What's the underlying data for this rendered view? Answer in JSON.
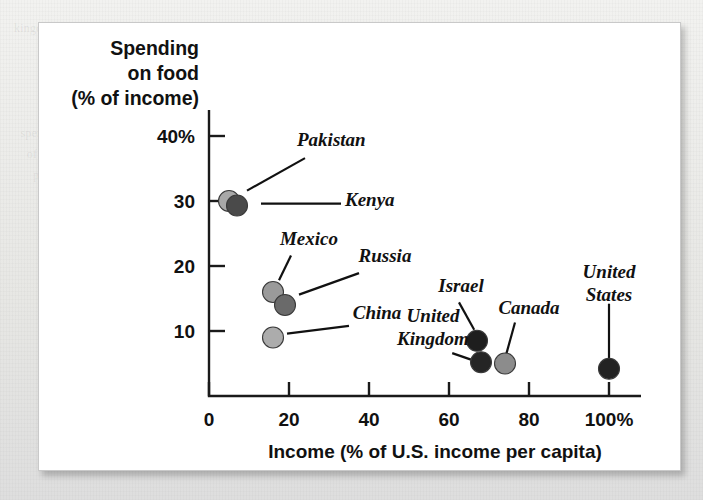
{
  "figure": {
    "card_name": "scatter-plot-figure"
  },
  "chart_data": {
    "type": "scatter",
    "title": "",
    "ylabel_lines": [
      "Spending",
      "on food",
      "(% of income)"
    ],
    "ylabel": "Spending on food (% of income)",
    "xlabel": "Income (% of U.S. income per capita)",
    "xlim": [
      0,
      108
    ],
    "ylim": [
      0,
      44
    ],
    "grid": false,
    "legend": "none",
    "xticks": [
      {
        "value": 0,
        "label": "0"
      },
      {
        "value": 20,
        "label": "20"
      },
      {
        "value": 40,
        "label": "40"
      },
      {
        "value": 60,
        "label": "60"
      },
      {
        "value": 80,
        "label": "80"
      },
      {
        "value": 100,
        "label": "100%"
      }
    ],
    "yticks": [
      {
        "value": 10,
        "label": "10"
      },
      {
        "value": 20,
        "label": "20"
      },
      {
        "value": 30,
        "label": "30"
      },
      {
        "value": 40,
        "label": "40%"
      }
    ],
    "points": [
      {
        "name": "Pakistan",
        "x": 5,
        "y": 30,
        "color": "#a8a8a8",
        "label_x": 22,
        "label_y": 38.5,
        "label_anchor": "start",
        "leader": [
          [
            24,
            36.6
          ],
          [
            9.5,
            31.6
          ]
        ]
      },
      {
        "name": "Kenya",
        "x": 7,
        "y": 29.3,
        "color": "#4a4a4a",
        "label_x": 34,
        "label_y": 29.2,
        "label_anchor": "start",
        "leader": [
          [
            33,
            29.6
          ],
          [
            13,
            29.6
          ]
        ]
      },
      {
        "name": "Mexico",
        "x": 16,
        "y": 16,
        "color": "#9a9a9a",
        "label_x": 25,
        "label_y": 23.3,
        "label_anchor": "middle",
        "leader": [
          [
            20.5,
            21.6
          ],
          [
            17.5,
            17.8
          ]
        ]
      },
      {
        "name": "Russia",
        "x": 19,
        "y": 14,
        "color": "#6a6a6a",
        "label_x": 44,
        "label_y": 20.6,
        "label_anchor": "middle",
        "leader": [
          [
            37.5,
            18.9
          ],
          [
            22.5,
            15.6
          ]
        ]
      },
      {
        "name": "China",
        "x": 16,
        "y": 9,
        "color": "#acacac",
        "label_x": 42,
        "label_y": 11.9,
        "label_anchor": "middle",
        "leader": [
          [
            35,
            10.8
          ],
          [
            19.5,
            9.6
          ]
        ]
      },
      {
        "name": "Israel",
        "x": 67,
        "y": 8.5,
        "color": "#1e1e1e",
        "label_x": 63,
        "label_y": 16.0,
        "label_anchor": "middle",
        "leader": [
          [
            62.5,
            14.4
          ],
          [
            66.3,
            10.2
          ]
        ]
      },
      {
        "name": "United Kingdom",
        "x": 68,
        "y": 5.2,
        "color": "#252525",
        "label_x": 56,
        "label_y": 11.4,
        "label_anchor": "middle",
        "leader": [
          [
            60.8,
            6.6
          ],
          [
            65.5,
            5.6
          ]
        ]
      },
      {
        "name": "Canada",
        "x": 74,
        "y": 5.0,
        "color": "#8c8c8c",
        "label_x": 80,
        "label_y": 12.6,
        "label_anchor": "middle",
        "leader": [
          [
            76.5,
            11.3
          ],
          [
            74.3,
            6.4
          ]
        ]
      },
      {
        "name": "United States",
        "x": 100,
        "y": 4.2,
        "color": "#232323",
        "label_x": 100,
        "label_y": 18.2,
        "label_anchor": "middle",
        "leader": [
          [
            100,
            14.2
          ],
          [
            100,
            5.6
          ]
        ]
      }
    ],
    "label_multiline": {
      "United Kingdom": [
        "United",
        "Kingdom"
      ],
      "United States": [
        "United",
        "States"
      ]
    },
    "colors": {
      "axis": "#1a1a1a",
      "text": "#111111",
      "card": "#ffffff",
      "page": "#e9e9e7"
    }
  },
  "background_ghost_text": "kingdom                    much less than half as much as the poorest                    who\n                           countries                                                        of\n\n         O  be Income                                                              the\n         countries to                                                      can\n  spending on food                                                 to\n    of income in the                                            be\n      poorest nations                                        and\n        of the world, while                              worth\n          wealthy families will                      In turn\n            spend a much                      income a\n              smaller share on                 a little\n                 necessities.                  which\n                    income a                          nation"
}
